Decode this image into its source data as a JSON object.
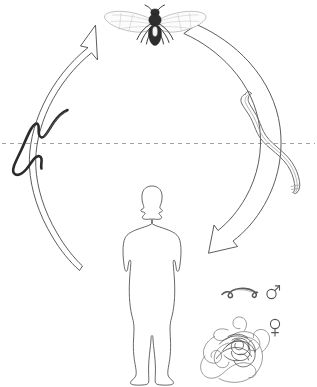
{
  "diagram": {
    "title": "Parasite life cycle diagram",
    "background_color": "#ffffff",
    "width": 317,
    "height": 387,
    "style": "hand-drawn black-and-white line illustration",
    "separator": {
      "name": "dashed-horizontal-line",
      "description": "dashed horizontal line crossing the full width, separating upper and lower halves of the cycle",
      "y_position": 143,
      "color": "#8c8c8c",
      "dash_pattern": "4 4"
    },
    "elements": [
      {
        "id": "fly-vector",
        "label": "fly",
        "description": "winged fly vector with dark body, spread translucent veined wings and visible legs, at the top of the cycle",
        "position": "top-center",
        "x": 155,
        "y": 25
      },
      {
        "id": "arrow-left",
        "label": "arrow up to fly",
        "description": "large outlined curved arrow on the left sweeping counter-clockwise upward, pointing toward the fly",
        "direction": "up-right",
        "tip_x": 95,
        "tip_y": 25
      },
      {
        "id": "arrow-right",
        "label": "arrow down to human",
        "description": "large outlined curved arrow on the right sweeping clockwise downward, pointing toward the human",
        "direction": "down-left",
        "tip_x": 208,
        "tip_y": 253
      },
      {
        "id": "larva-left",
        "label": "dark larva",
        "description": "dark slender sinuous worm crossing the dashed line on the left side of the cycle",
        "position": "left",
        "x": 40,
        "y": 145
      },
      {
        "id": "larva-right",
        "label": "infective larva",
        "description": "thicker grey-outlined worm crossing the dashed line on the right side of the cycle",
        "position": "right",
        "x": 275,
        "y": 140
      },
      {
        "id": "human-host",
        "label": "human host",
        "description": "outlined standing human silhouette, front view, arms at sides, at the centre of the cycle",
        "position": "center-bottom",
        "x": 152,
        "y": 285
      },
      {
        "id": "adult-male-worm",
        "label": "adult male worm",
        "description": "small short curled adult worm shown next to the male symbol",
        "position": "bottom-right",
        "x": 238,
        "y": 292
      },
      {
        "id": "adult-female-worm",
        "label": "adult female worm",
        "description": "large long tangled coiled adult worm shown next to the female symbol",
        "position": "bottom-right",
        "x": 240,
        "y": 352
      }
    ],
    "symbols": [
      {
        "id": "male-symbol",
        "name": "mars-male-icon",
        "glyph": "♂",
        "meaning": "male",
        "x": 272,
        "y": 291
      },
      {
        "id": "female-symbol",
        "name": "venus-female-icon",
        "glyph": "♀",
        "meaning": "female",
        "x": 275,
        "y": 326
      }
    ]
  }
}
